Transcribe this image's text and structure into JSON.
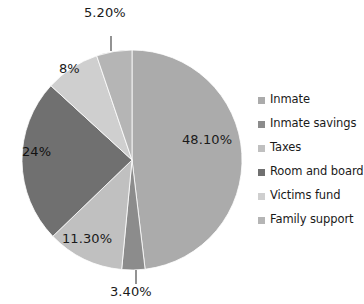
{
  "chart_data": {
    "type": "pie",
    "title": "",
    "categories": [
      "Inmate",
      "Inmate savings",
      "Taxes",
      "Room and board",
      "Victims fund",
      "Family support"
    ],
    "values": [
      48.1,
      3.4,
      11.3,
      24.0,
      8.0,
      5.2
    ],
    "value_labels": [
      "48.10%",
      "3.40%",
      "11.30%",
      "24%",
      "8%",
      "5.20%"
    ],
    "colors": [
      "#ababab",
      "#8c8c8c",
      "#c0c0c0",
      "#707070",
      "#cfcfcf",
      "#b5b5b5"
    ],
    "start_angle_deg": 0,
    "direction": "clockwise",
    "legend_position": "right",
    "grid": false,
    "xlabel": "",
    "ylabel": ""
  },
  "legend": {
    "items": [
      {
        "label": "Inmate",
        "color": "#ababab"
      },
      {
        "label": "Inmate savings",
        "color": "#8c8c8c"
      },
      {
        "label": "Taxes",
        "color": "#c0c0c0"
      },
      {
        "label": "Room and board",
        "color": "#707070"
      },
      {
        "label": "Victims fund",
        "color": "#cfcfcf"
      },
      {
        "label": "Family support",
        "color": "#b5b5b5"
      }
    ]
  },
  "labels": {
    "inmate": "48.10%",
    "inmate_savings": "3.40%",
    "taxes": "11.30%",
    "room_and_board": "24%",
    "victims_fund": "8%",
    "family_support": "5.20%"
  }
}
